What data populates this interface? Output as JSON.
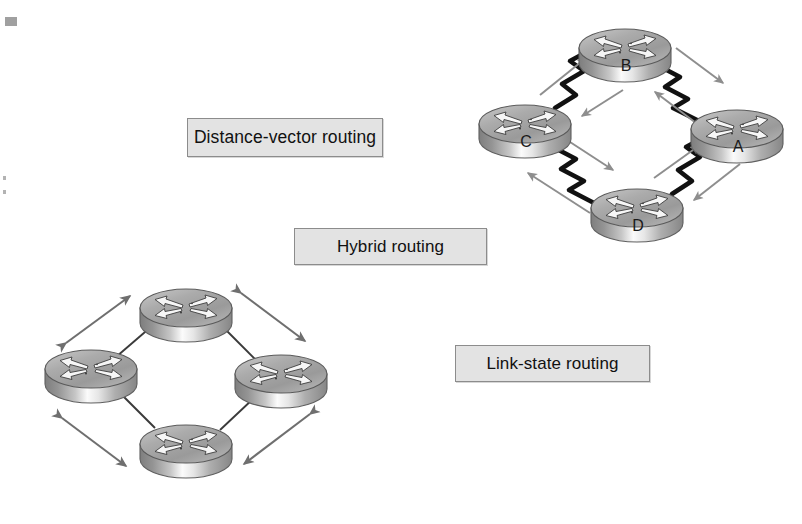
{
  "figure": {
    "background_color": "#ffffff",
    "width": 802,
    "height": 524
  },
  "labels": {
    "distance_vector": "Distance-vector routing",
    "hybrid": "Hybrid routing",
    "link_state": "Link-state routing",
    "box_fill_color": "#e3e3e3",
    "box_border_color": "#8c8c8c",
    "text_color": "#111111"
  },
  "diagrams": [
    {
      "id": "distance-vector-topology",
      "name": "Distance-vector routing topology",
      "link_style": "zigzag-serial",
      "link_color": "#111111",
      "arrow_style": "single-headed",
      "arrow_color": "#8e8e8e",
      "routers": [
        {
          "label": "B",
          "cx": 625,
          "cy": 50
        },
        {
          "label": "C",
          "cx": 525,
          "cy": 126
        },
        {
          "label": "A",
          "cx": 737,
          "cy": 131
        },
        {
          "label": "D",
          "cx": 637,
          "cy": 210
        }
      ],
      "links": [
        {
          "from": "C",
          "to": "B"
        },
        {
          "from": "B",
          "to": "A"
        },
        {
          "from": "C",
          "to": "D"
        },
        {
          "from": "D",
          "to": "A"
        }
      ]
    },
    {
      "id": "link-state-topology",
      "name": "Link-state routing topology",
      "link_style": "straight",
      "link_color": "#3a3a3a",
      "arrow_style": "double-headed",
      "arrow_color": "#6f6f6f",
      "routers": [
        {
          "label": "",
          "cx": 186,
          "cy": 310
        },
        {
          "label": "",
          "cx": 91,
          "cy": 371
        },
        {
          "label": "",
          "cx": 281,
          "cy": 376
        },
        {
          "label": "",
          "cx": 186,
          "cy": 446
        }
      ],
      "links": [
        {
          "from": "top",
          "to": "left"
        },
        {
          "from": "top",
          "to": "right"
        },
        {
          "from": "left",
          "to": "bottom"
        },
        {
          "from": "right",
          "to": "bottom"
        }
      ]
    }
  ],
  "router_icon": {
    "name": "router-icon",
    "shape": "cylinder",
    "top_fill": "#a9a9a9",
    "body_fill": "#8f8f8f",
    "highlight": "#f2f2f2",
    "outline": "#5a5a5a",
    "top_glyph": "four-arrows"
  },
  "artifacts": {
    "scan_speckles": 3
  }
}
